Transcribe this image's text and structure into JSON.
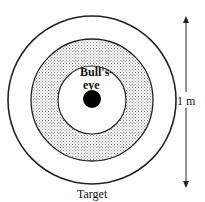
{
  "diagram": {
    "title": "Target",
    "center_label_line1": "Bull's-",
    "center_label_line2": "eye",
    "dimension_label": "1 m",
    "colors": {
      "stroke": "#222222",
      "ring_fill": "#d9d9d9",
      "bullseye": "#000000",
      "background": "#ffffff"
    }
  }
}
